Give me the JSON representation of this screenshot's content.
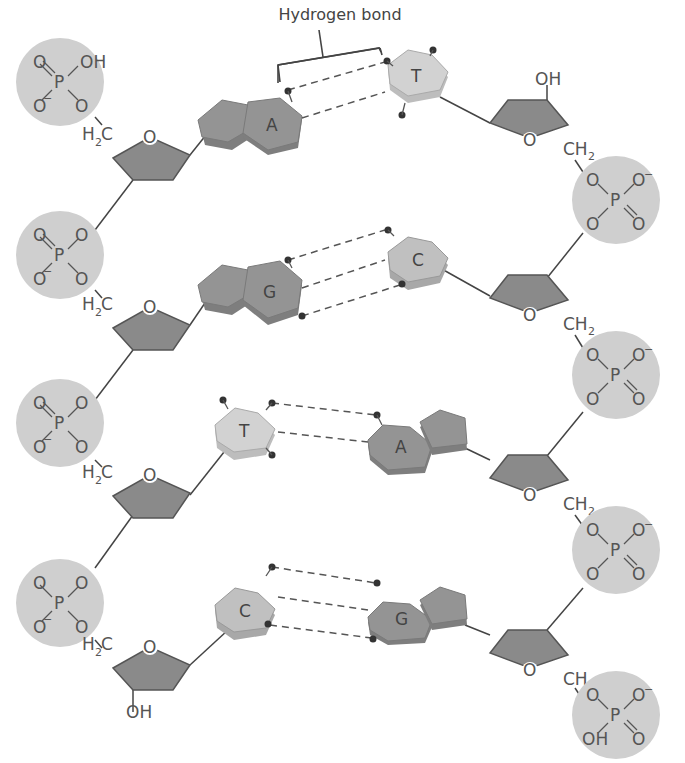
{
  "title_label": "Hydrogen bond",
  "colors": {
    "phosphate": "#cfcfcf",
    "sugar": "#8a8a8a",
    "purine": "#949494",
    "pyrimidine": "#d2d2d2",
    "line": "#444444",
    "text": "#555555"
  },
  "left_strand": {
    "nucleotides": [
      {
        "base": "A",
        "phosphate": [
          "O",
          "OH",
          "P",
          "O",
          "O"
        ],
        "phosphate_charge": "−",
        "ch2": "H",
        "ch2_sub": "2",
        "ch2_c": "C",
        "ring_o": "O"
      },
      {
        "base": "G",
        "phosphate": [
          "O",
          "O",
          "P",
          "O",
          "O"
        ],
        "phosphate_charge": "−",
        "ch2": "H",
        "ch2_sub": "2",
        "ch2_c": "C",
        "ring_o": "O"
      },
      {
        "base": "T",
        "phosphate": [
          "O",
          "O",
          "P",
          "O",
          "O"
        ],
        "phosphate_charge": "−",
        "ch2": "H",
        "ch2_sub": "2",
        "ch2_c": "C",
        "ring_o": "O"
      },
      {
        "base": "C",
        "phosphate": [
          "O",
          "O",
          "P",
          "O",
          "O"
        ],
        "phosphate_charge": "−",
        "ch2": "H",
        "ch2_sub": "2",
        "ch2_c": "C",
        "ring_o": "O"
      }
    ],
    "terminal_oh": "OH"
  },
  "right_strand": {
    "nucleotides": [
      {
        "base": "T",
        "ring_o": "O",
        "ch2": "CH",
        "ch2_sub": "2"
      },
      {
        "base": "C",
        "ring_o": "O",
        "ch2": "CH",
        "ch2_sub": "2"
      },
      {
        "base": "A",
        "ring_o": "O",
        "ch2": "CH",
        "ch2_sub": "2"
      },
      {
        "base": "G",
        "ring_o": "O",
        "ch2": "CH",
        "ch2_sub": "2"
      }
    ],
    "terminal_oh": "OH",
    "phosphates": [
      {
        "atoms": [
          "O",
          "O",
          "P",
          "O",
          "O"
        ],
        "charge": "−"
      },
      {
        "atoms": [
          "O",
          "O",
          "P",
          "O",
          "O"
        ],
        "charge": "−"
      },
      {
        "atoms": [
          "O",
          "O",
          "P",
          "O",
          "O"
        ],
        "charge": "−"
      },
      {
        "atoms": [
          "O",
          "O",
          "P",
          "OH",
          "O"
        ],
        "charge": "−"
      }
    ]
  },
  "base_pairs": [
    {
      "left": "A",
      "right": "T",
      "hydrogen_bonds": 2
    },
    {
      "left": "G",
      "right": "C",
      "hydrogen_bonds": 3
    },
    {
      "left": "T",
      "right": "A",
      "hydrogen_bonds": 2
    },
    {
      "left": "C",
      "right": "G",
      "hydrogen_bonds": 3
    }
  ]
}
